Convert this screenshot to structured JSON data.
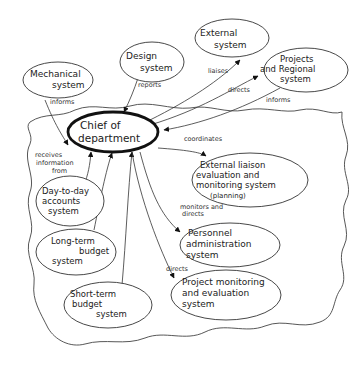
{
  "diagram": {
    "central": {
      "id": "chief",
      "lines": [
        "Chief of",
        "department"
      ]
    },
    "external_nodes": [
      {
        "id": "mechanical",
        "lines": [
          "Mechanical",
          "system"
        ]
      },
      {
        "id": "design",
        "lines": [
          "Design",
          "system"
        ]
      },
      {
        "id": "external",
        "lines": [
          "External",
          "system"
        ]
      },
      {
        "id": "projects-regional",
        "lines": [
          "Projects",
          "and Regional",
          "system"
        ]
      }
    ],
    "internal_nodes": [
      {
        "id": "day-to-day",
        "lines": [
          "Day-to-day",
          "accounts",
          "system"
        ]
      },
      {
        "id": "long-term",
        "lines": [
          "Long-term",
          "budget",
          "system"
        ]
      },
      {
        "id": "short-term",
        "lines": [
          "Short-term",
          "budget",
          "system"
        ]
      },
      {
        "id": "external-liaison",
        "lines": [
          "External liaison",
          "evaluation and",
          "monitoring system",
          "(planning)"
        ]
      },
      {
        "id": "personnel",
        "lines": [
          "Personnel",
          "administration",
          "system"
        ]
      },
      {
        "id": "project-monitoring",
        "lines": [
          "Project monitoring",
          "and evaluation",
          "system"
        ]
      }
    ],
    "edges": [
      {
        "from": "mechanical",
        "to": "chief",
        "label": "informs"
      },
      {
        "from": "design",
        "to": "chief",
        "label": "reports"
      },
      {
        "from": "chief",
        "to": "external",
        "label": "liaises"
      },
      {
        "from": "chief",
        "to": "projects-regional",
        "label": "directs"
      },
      {
        "from": "projects-regional",
        "to": "chief",
        "label": "informs"
      },
      {
        "from": "chief",
        "to": "external-liaison",
        "label": "coordinates"
      },
      {
        "from": "day-to-day",
        "to": "chief",
        "label": "receives information from",
        "label_lines": [
          "receives",
          "information",
          "from"
        ]
      },
      {
        "from": "long-term",
        "to": "chief",
        "label": ""
      },
      {
        "from": "short-term",
        "to": "chief",
        "label": ""
      },
      {
        "from": "chief",
        "to": "personnel",
        "label": "monitors and directs",
        "label_lines": [
          "monitors and",
          "directs"
        ]
      },
      {
        "from": "chief",
        "to": "project-monitoring",
        "label": "directs"
      }
    ]
  }
}
